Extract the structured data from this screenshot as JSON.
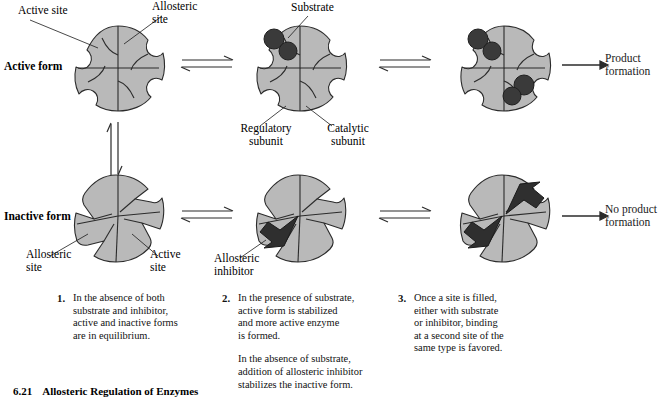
{
  "figure": {
    "number": "6.21",
    "title": "Allosteric Regulation of Enzymes"
  },
  "rows": [
    {
      "label": "Active form"
    },
    {
      "label": "Inactive form"
    }
  ],
  "annotations": {
    "active_site_top": "Active site",
    "allosteric_site_top": "Allosteric\nsite",
    "substrate": "Substrate",
    "regulatory_subunit": "Regulatory\nsubunit",
    "catalytic_subunit": "Catalytic\nsubunit",
    "allosteric_site_bottom": "Allosteric\nsite",
    "active_site_bottom": "Active\nsite",
    "allosteric_inhibitor": "Allosteric\ninhibitor"
  },
  "outcomes": {
    "product": "Product\nformation",
    "no_product": "No product\nformation"
  },
  "steps": [
    {
      "number": "1.",
      "paragraphs": [
        "In the absence of both\nsubstrate and inhibitor,\nactive and inactive forms\nare in equilibrium."
      ]
    },
    {
      "number": "2.",
      "paragraphs": [
        "In the presence of substrate,\nactive form is stabilized\nand more active enzyme\nis formed.",
        "In the absence of substrate,\naddition of allosteric inhibitor\nstabilizes the inactive form."
      ]
    },
    {
      "number": "3.",
      "paragraphs": [
        "Once a site is filled,\neither with substrate\nor inhibitor, binding\nat a second site of the\nsame type is favored."
      ]
    }
  ],
  "colors": {
    "enzyme_fill": "#b9b9b9",
    "enzyme_stroke": "#2b2b2b",
    "ligand_dark": "#3a3a3a",
    "arrow": "#2b2b2b",
    "text": "#111111"
  },
  "icons": {
    "equilibrium": "equilibrium-arrow",
    "reaction": "reaction-arrow",
    "enzyme_active": "active-enzyme-icon",
    "enzyme_inactive": "inactive-enzyme-icon",
    "substrate": "substrate-icon",
    "inhibitor": "inhibitor-icon"
  }
}
